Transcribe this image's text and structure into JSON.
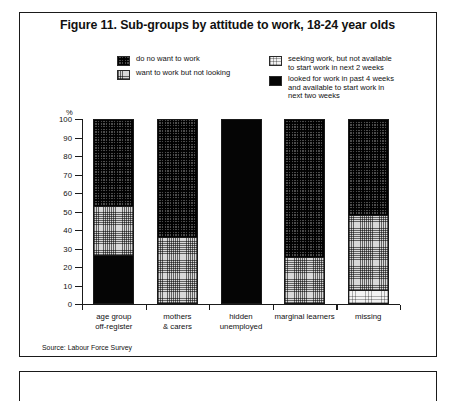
{
  "figure": {
    "title": "Figure 11. Sub-groups by attitude to work, 18-24 year olds",
    "source_note": "Source: Labour Force Survey"
  },
  "legend": {
    "left": [
      {
        "key": "do-no-want-to-work",
        "label": "do no want to work",
        "pattern": "fill-dark"
      },
      {
        "key": "want-to-work-but-not-looking",
        "label": "want to work but not looking",
        "pattern": "fill-mid"
      }
    ],
    "right": [
      {
        "key": "seeking-not-available",
        "label": "seeking work, but not available\nto start work in next 2 weeks",
        "pattern": "fill-light"
      },
      {
        "key": "looked-and-available",
        "label": "looked for work in past 4 weeks\nand available to start work in\nnext two weeks",
        "pattern": "fill-black"
      }
    ]
  },
  "axes": {
    "y_unit_label": "%",
    "y_ticks": [
      "100",
      "90",
      "80",
      "70",
      "60",
      "50",
      "40",
      "30",
      "20",
      "10",
      "0"
    ]
  },
  "chart_data": {
    "type": "bar",
    "stacked": true,
    "percent_stacked": true,
    "title": "Figure 11. Sub-groups by attitude to work, 18-24 year olds",
    "xlabel": "",
    "ylabel": "%",
    "ylim": [
      0,
      100
    ],
    "ytick_step": 10,
    "grid": false,
    "legend_position": "top-center",
    "categories": [
      "age group\noff-register",
      "mothers\n& carers",
      "hidden\nunemployed",
      "marginal learners",
      "missing"
    ],
    "category_labels_flat": [
      "age group off-register",
      "mothers & carers",
      "hidden unemployed",
      "marginal learners",
      "missing"
    ],
    "series": [
      {
        "name": "do no want to work",
        "pattern": "fill-dark",
        "values": [
          47,
          64,
          0,
          75,
          52
        ]
      },
      {
        "name": "want to work but not looking",
        "pattern": "fill-mid",
        "values": [
          27,
          36,
          0,
          25,
          41
        ]
      },
      {
        "name": "seeking work, but not available to start work in next 2 weeks",
        "pattern": "fill-light",
        "values": [
          0,
          0,
          0,
          0,
          7
        ]
      },
      {
        "name": "looked for work in past 4 weeks and available to start work in next two weeks",
        "pattern": "fill-black",
        "values": [
          26,
          0,
          100,
          0,
          0
        ]
      }
    ],
    "stack_order_top_to_bottom": [
      "do no want to work",
      "want to work but not looking",
      "seeking work, but not available to start work in next 2 weeks",
      "looked for work in past 4 weeks and available to start work in next two weeks"
    ],
    "colors": {
      "do no want to work": "#4a4a4a",
      "want to work but not looking": "#d8d8d8",
      "seeking work, but not available to start work in next 2 weeks": "#f2f2f2",
      "looked for work in past 4 weeks and available to start work in next two weeks": "#050505",
      "axis": "#1a1a1a",
      "background": "#ffffff"
    }
  }
}
